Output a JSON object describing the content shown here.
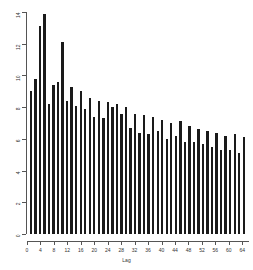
{
  "chart_data": {
    "type": "bar",
    "title": "",
    "xlabel": "Lag",
    "ylabel": "",
    "xlim": [
      0,
      66
    ],
    "ylim": [
      0,
      14
    ],
    "grid": false,
    "legend": null,
    "bar_color": "#1a1a1a",
    "axis_color": "#555555",
    "x": [
      2,
      4,
      6,
      8,
      10,
      12,
      14,
      16,
      18,
      20,
      22,
      24,
      26,
      28,
      30,
      32,
      34,
      36,
      38,
      40,
      42,
      44,
      46,
      48,
      50,
      52,
      54,
      56,
      58,
      60,
      62,
      64
    ],
    "categories": [
      "2",
      "4",
      "6",
      "8",
      "10",
      "12",
      "14",
      "16",
      "18",
      "20",
      "22",
      "24",
      "26",
      "28",
      "30",
      "32",
      "34",
      "36",
      "38",
      "40",
      "42",
      "44",
      "46",
      "48",
      "50",
      "52",
      "54",
      "56",
      "58",
      "60",
      "62",
      "64"
    ],
    "values": [
      9.0,
      9.8,
      13.1,
      13.9,
      8.2,
      9.4,
      9.6,
      12.1,
      8.4,
      9.3,
      8.1,
      9.0,
      7.9,
      8.6,
      7.4,
      8.4,
      7.3,
      8.3,
      8.0,
      8.2,
      7.6,
      8.0,
      6.7,
      7.6,
      6.4,
      7.5,
      6.3,
      7.4,
      6.5,
      7.2,
      6.0,
      7.0
    ],
    "values_tail": [
      6.2,
      7.1,
      5.8,
      6.8,
      5.8,
      6.6,
      5.7,
      6.5,
      5.5,
      6.4,
      5.3,
      6.2,
      5.3,
      6.3,
      5.1,
      6.1
    ],
    "xticks": [
      0,
      4,
      8,
      12,
      16,
      20,
      24,
      28,
      32,
      36,
      40,
      44,
      48,
      52,
      56,
      60,
      64
    ],
    "xticklabels": [
      "0",
      "4",
      "8",
      "12",
      "16",
      "20",
      "24",
      "28",
      "32",
      "36",
      "40",
      "44",
      "48",
      "52",
      "56",
      "60",
      "64"
    ],
    "yticks": [
      0,
      2,
      4,
      6,
      8,
      10,
      12,
      14
    ],
    "yticklabels": [
      "0",
      "2",
      "4",
      "6",
      "8",
      "10",
      "12",
      "14"
    ]
  }
}
